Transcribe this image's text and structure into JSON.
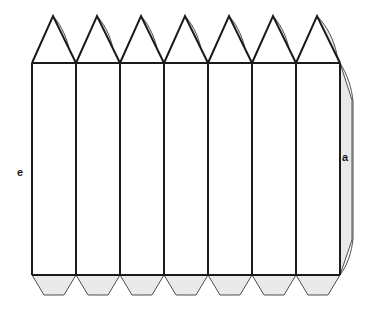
{
  "figure": {
    "name": "heptagonal-prism-net",
    "background_color": "#ffffff",
    "stroke_color": "#1a1a1a",
    "flap_fill_color": "#e9e9e9",
    "flap_stroke_color": "#4d4d4d",
    "face_fill_color": "#ffffff"
  },
  "labels": [
    {
      "id": "edge-label-e",
      "text": "e",
      "x": 20,
      "y": 173,
      "describes": "left vertical edge of first rectangular face"
    },
    {
      "id": "edge-label-a",
      "text": "a",
      "x": 345,
      "y": 158,
      "describes": "right glue flap edge of last rectangular face"
    }
  ],
  "geometry": {
    "panel_count": 7,
    "panel_width": 44,
    "left_x": 32,
    "right_x": 340,
    "body_top_y": 63,
    "body_bottom_y": 275,
    "apex_y": 16,
    "bottom_flap_depth": 20,
    "bottom_flap_inset": 12,
    "column_x": [
      32,
      76,
      120,
      164,
      208,
      252,
      296,
      340
    ],
    "apex_x": [
      53,
      97,
      141,
      185,
      229,
      273,
      317
    ],
    "top_triangle_flap_bulge": 11,
    "right_flap_width": 18
  },
  "parts": {
    "rectangular_faces": 7,
    "top_triangles": 7,
    "top_triangle_flaps": 7,
    "bottom_flaps": 7,
    "side_flaps": 1
  }
}
